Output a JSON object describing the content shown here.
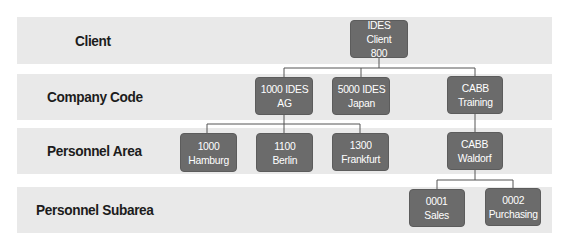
{
  "diagram": {
    "levels": [
      {
        "id": "client",
        "label": "Client"
      },
      {
        "id": "company-code",
        "label": "Company Code"
      },
      {
        "id": "personnel-area",
        "label": "Personnel Area"
      },
      {
        "id": "personnel-subarea",
        "label": "Personnel Subarea"
      }
    ],
    "nodes": {
      "client_800": {
        "line1": "IDES Client",
        "line2": "800",
        "level": "Client"
      },
      "cc_1000": {
        "line1": "1000 IDES",
        "line2": "AG",
        "level": "Company Code",
        "parent": "IDES Client 800"
      },
      "cc_5000": {
        "line1": "5000 IDES",
        "line2": "Japan",
        "level": "Company Code",
        "parent": "IDES Client 800"
      },
      "cc_cabb": {
        "line1": "CABB",
        "line2": "Training",
        "level": "Company Code",
        "parent": "IDES Client 800"
      },
      "pa_1000": {
        "line1": "1000",
        "line2": "Hamburg",
        "level": "Personnel Area",
        "parent": "1000 IDES AG"
      },
      "pa_1100": {
        "line1": "1100",
        "line2": "Berlin",
        "level": "Personnel Area",
        "parent": "1000 IDES AG"
      },
      "pa_1300": {
        "line1": "1300",
        "line2": "Frankfurt",
        "level": "Personnel Area",
        "parent": "1000 IDES AG"
      },
      "pa_cabb": {
        "line1": "CABB",
        "line2": "Waldorf",
        "level": "Personnel Area",
        "parent": "CABB Training"
      },
      "psa_0001": {
        "line1": "0001",
        "line2": "Sales",
        "level": "Personnel Subarea",
        "parent": "CABB Waldorf"
      },
      "psa_0002": {
        "line1": "0002",
        "line2": "Purchasing",
        "level": "Personnel Subarea",
        "parent": "CABB Waldorf"
      }
    },
    "colors": {
      "band": "#e9e9e9",
      "node": "#6b6b6b",
      "node_text": "#ffffff",
      "connector": "#555555",
      "label_text": "#1c1c1c"
    }
  }
}
